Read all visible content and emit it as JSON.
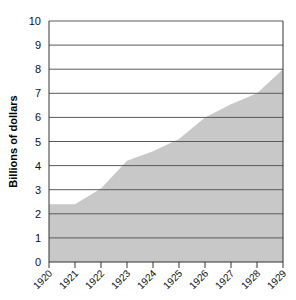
{
  "chart_data": {
    "type": "area",
    "title": "",
    "subtitle": "",
    "xlabel": "",
    "ylabel": "Billions of dollars",
    "categories": [
      "1920",
      "1921",
      "1922",
      "1923",
      "1924",
      "1925",
      "1926",
      "1927",
      "1928",
      "1929"
    ],
    "x": [
      1920,
      1921,
      1922,
      1923,
      1924,
      1925,
      1926,
      1927,
      1928,
      1929
    ],
    "values": [
      2.4,
      2.4,
      3.05,
      4.2,
      4.6,
      5.1,
      6.0,
      6.55,
      7.0,
      8.0
    ],
    "ylim": [
      0,
      10
    ],
    "xlim": [
      1920,
      1929
    ],
    "ytick_labels": [
      "0",
      "1",
      "2",
      "3",
      "4",
      "5",
      "6",
      "7",
      "8",
      "9",
      "10"
    ],
    "ytick_values": [
      0,
      1,
      2,
      3,
      4,
      5,
      6,
      7,
      8,
      9,
      10
    ],
    "grid": true,
    "legend": null,
    "legend_position": "none",
    "series": [
      {
        "name": "Billions of dollars",
        "values": [
          2.4,
          2.4,
          3.05,
          4.2,
          4.6,
          5.1,
          6.0,
          6.55,
          7.0,
          8.0
        ]
      }
    ]
  },
  "style": {
    "area_fill": "#c8c8c8",
    "gridline_color": "#5a5a5a",
    "axis_color": "#333333",
    "background": "#ffffff",
    "text_color": "#111111"
  },
  "axes": {
    "y_axis_title": "Billions of dollars",
    "x_axis_title": ""
  }
}
